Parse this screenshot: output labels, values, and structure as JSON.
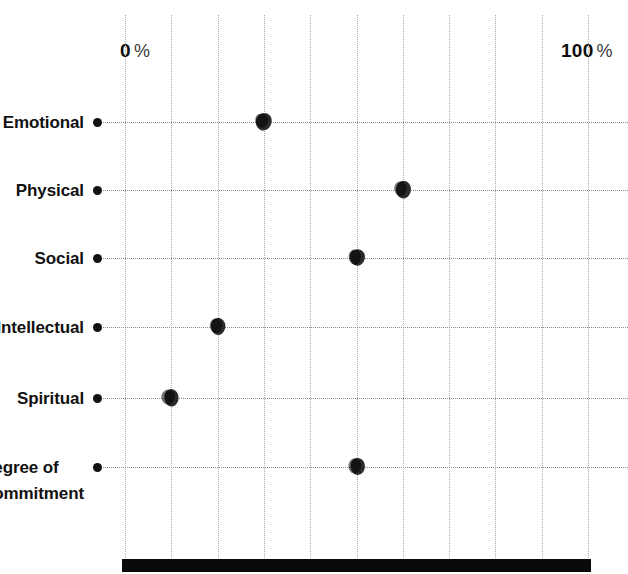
{
  "chart_data": {
    "type": "scatter",
    "title": "",
    "subtitle": "",
    "xlabel": "",
    "ylabel": "",
    "xlim": [
      0,
      100
    ],
    "grid": true,
    "grid_orientation": "both",
    "legend": "none",
    "orientation": "horizontal",
    "axis_min_label": "0",
    "axis_max_label": "100",
    "axis_unit": "%",
    "x_ticks": [
      0,
      10,
      20,
      30,
      40,
      50,
      60,
      70,
      80,
      90,
      100
    ],
    "x_tick_labels": [
      "0 %",
      "",
      "",
      "",
      "",
      "",
      "",
      "",
      "",
      "",
      "100 %"
    ],
    "categories": [
      "Emotional",
      "Physical",
      "Social",
      "Intellectual",
      "Spiritual",
      "Degree of\nCommitment"
    ],
    "values": [
      30,
      60,
      50,
      20,
      10,
      50
    ],
    "series": [
      {
        "name": "Rating",
        "values": [
          30,
          60,
          50,
          20,
          10,
          50
        ]
      }
    ],
    "points": [
      {
        "label": "Emotional",
        "value": 30
      },
      {
        "label": "Physical",
        "value": 60
      },
      {
        "label": "Social",
        "value": 50
      },
      {
        "label": "Intellectual",
        "value": 20
      },
      {
        "label": "Spiritual",
        "value": 10
      },
      {
        "label": "Degree of Commitment",
        "value": 50
      }
    ],
    "annotations": [],
    "colors": {
      "marker": "#2b2b2b",
      "bullet": "#111111",
      "gridline": "#aaaaaa",
      "rowline": "#8a8a8a",
      "baseline_bar": "#0a0a0a",
      "text": "#111111",
      "background": "#ffffff"
    }
  },
  "axis": {
    "min_number": "0",
    "min_unit": "%",
    "max_number": "100",
    "max_unit": "%"
  },
  "rows": [
    {
      "label": "Emotional",
      "label_line2": ""
    },
    {
      "label": "Physical",
      "label_line2": ""
    },
    {
      "label": "Social",
      "label_line2": ""
    },
    {
      "label": "Intellectual",
      "label_line2": ""
    },
    {
      "label": "Spiritual",
      "label_line2": ""
    },
    {
      "label": "Degree of",
      "label_line2": "Commitment"
    }
  ]
}
